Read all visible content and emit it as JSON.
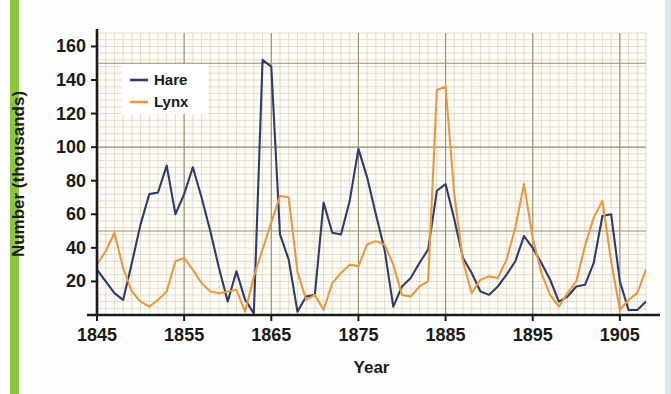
{
  "figure": {
    "accent_color": "#8cc63e",
    "background_color": "#fdfdfc",
    "plot_background_color": "#fefdf8",
    "grid_minor_color": "#d9cdb6",
    "grid_major_color": "#9d8b6e",
    "axis_color": "#1a1a1a"
  },
  "chart_data": {
    "type": "line",
    "title": "",
    "xlabel": "Year",
    "ylabel": "Number (thousands)",
    "xlim": [
      1845,
      1908
    ],
    "ylim": [
      0,
      168
    ],
    "xticks": [
      1845,
      1855,
      1865,
      1875,
      1885,
      1895,
      1905
    ],
    "xtick_labels": [
      "1845",
      "1855",
      "1865",
      "1875",
      "1885",
      "1895",
      "1905"
    ],
    "yticks": [
      20,
      40,
      60,
      80,
      100,
      120,
      140,
      160
    ],
    "ytick_labels": [
      "20",
      "40",
      "60",
      "80",
      "100",
      "120",
      "140",
      "160"
    ],
    "grid": true,
    "grid_minor_step_x": 1,
    "grid_minor_step_y": 4,
    "grid_major_step_x": 10,
    "grid_major_step_y": 50,
    "legend_position": "upper-left",
    "x": [
      1845,
      1846,
      1847,
      1848,
      1849,
      1850,
      1851,
      1852,
      1853,
      1854,
      1855,
      1856,
      1857,
      1858,
      1859,
      1860,
      1861,
      1862,
      1863,
      1864,
      1865,
      1866,
      1867,
      1868,
      1869,
      1870,
      1871,
      1872,
      1873,
      1874,
      1875,
      1876,
      1877,
      1878,
      1879,
      1880,
      1881,
      1882,
      1883,
      1884,
      1885,
      1886,
      1887,
      1888,
      1889,
      1890,
      1891,
      1892,
      1893,
      1894,
      1895,
      1896,
      1897,
      1898,
      1899,
      1900,
      1901,
      1902,
      1903,
      1904,
      1905,
      1906,
      1907,
      1908
    ],
    "series": [
      {
        "name": "Hare",
        "color": "#2e3b6e",
        "values": [
          27,
          20,
          13,
          9,
          31,
          54,
          72,
          73,
          89,
          60,
          72,
          88,
          70,
          50,
          28,
          8,
          26,
          9,
          1,
          152,
          148,
          48,
          33,
          2,
          11,
          12,
          67,
          49,
          48,
          68,
          99,
          82,
          60,
          39,
          5,
          17,
          22,
          31,
          39,
          74,
          78,
          57,
          34,
          25,
          14,
          12,
          17,
          24,
          32,
          47,
          40,
          31,
          21,
          8,
          11,
          17,
          18,
          31,
          59,
          60,
          20,
          3,
          3,
          8
        ]
      },
      {
        "name": "Lynx",
        "color": "#eb9740",
        "values": [
          30,
          38,
          49,
          28,
          14,
          8,
          5,
          9,
          14,
          32,
          34,
          27,
          19,
          14,
          13,
          14,
          15,
          2,
          23,
          39,
          55,
          71,
          70,
          26,
          9,
          12,
          3,
          19,
          25,
          30,
          29,
          42,
          44,
          42,
          30,
          12,
          11,
          17,
          20,
          134,
          136,
          72,
          32,
          13,
          21,
          23,
          22,
          33,
          52,
          78,
          46,
          25,
          12,
          5,
          13,
          20,
          41,
          58,
          68,
          32,
          3,
          9,
          13,
          27
        ]
      }
    ]
  },
  "legend": {
    "entries": [
      {
        "label": "Hare",
        "color": "#2e3b6e"
      },
      {
        "label": "Lynx",
        "color": "#eb9740"
      }
    ]
  }
}
